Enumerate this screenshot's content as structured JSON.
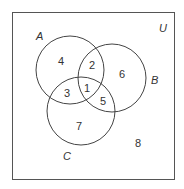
{
  "diagram": {
    "type": "venn",
    "universe_label": "U",
    "sets": [
      {
        "label": "A"
      },
      {
        "label": "B"
      },
      {
        "label": "C"
      }
    ],
    "regions": [
      {
        "id": "1",
        "label": "1",
        "membership": "A∩B∩C"
      },
      {
        "id": "2",
        "label": "2",
        "membership": "A∩B only"
      },
      {
        "id": "3",
        "label": "3",
        "membership": "A∩C only"
      },
      {
        "id": "4",
        "label": "4",
        "membership": "A only"
      },
      {
        "id": "5",
        "label": "5",
        "membership": "B∩C only"
      },
      {
        "id": "6",
        "label": "6",
        "membership": "B only"
      },
      {
        "id": "7",
        "label": "7",
        "membership": "C only"
      },
      {
        "id": "8",
        "label": "8",
        "membership": "none"
      }
    ]
  }
}
